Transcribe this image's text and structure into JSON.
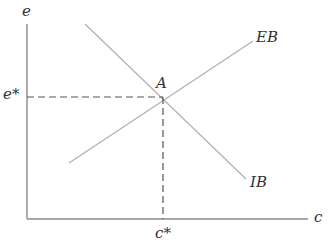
{
  "diagram": {
    "colors": {
      "axis": "#8a8a8a",
      "curve": "#b0b0b0",
      "dashed": "#555555",
      "text": "#333333"
    },
    "axes": {
      "y_label": "e",
      "x_label": "c"
    },
    "curves": [
      {
        "name": "EB",
        "label": "EB",
        "direction": "upward-sloping"
      },
      {
        "name": "IB",
        "label": "IB",
        "direction": "downward-sloping"
      }
    ],
    "equilibrium": {
      "point_label": "A",
      "y_value_label": "e*",
      "x_value_label": "c*"
    }
  }
}
